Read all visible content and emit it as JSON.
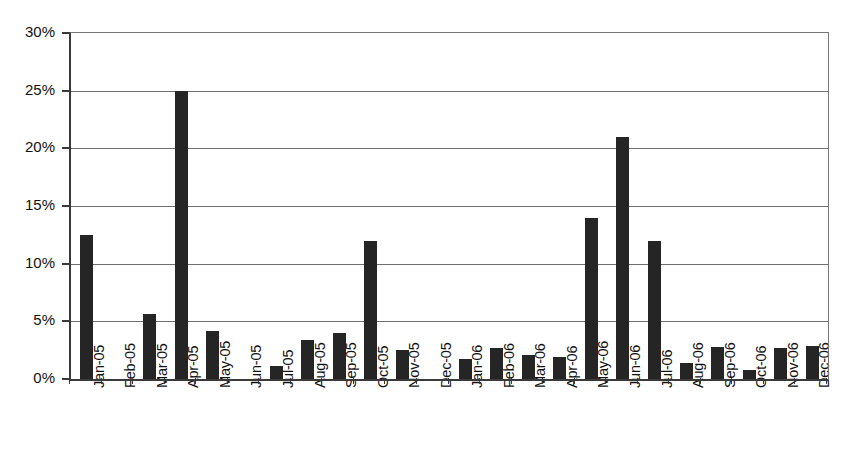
{
  "chart_data": {
    "type": "bar",
    "title": "",
    "xlabel": "",
    "ylabel": "",
    "ylim": [
      0,
      30
    ],
    "ytick_values": [
      0,
      5,
      10,
      15,
      20,
      25,
      30
    ],
    "ytick_labels": [
      "0%",
      "5%",
      "10%",
      "15%",
      "20%",
      "25%",
      "30%"
    ],
    "grid": true,
    "legend": "none",
    "value_suffix": "%",
    "bar_color": "#252525",
    "axis_color": "#3a3a3a",
    "grid_color": "#6f6f6f",
    "categories": [
      "Jan-05",
      "Feb-05",
      "Mar-05",
      "Apr-05",
      "May-05",
      "Jun-05",
      "Jul-05",
      "Aug-05",
      "Sep-05",
      "Oct-05",
      "Nov-05",
      "Dec-05",
      "Jan-06",
      "Feb-06",
      "Mar-06",
      "Apr-06",
      "May-06",
      "Jun-06",
      "Jul-06",
      "Aug-06",
      "Sep-06",
      "Oct-06",
      "Nov-06",
      "Dec-06"
    ],
    "values": [
      12.5,
      0,
      5.6,
      25.0,
      4.2,
      0,
      1.1,
      3.4,
      4.0,
      12.0,
      2.5,
      0,
      1.7,
      2.7,
      2.1,
      1.9,
      14.0,
      21.0,
      12.0,
      1.4,
      2.8,
      0.8,
      2.7,
      2.9
    ]
  }
}
